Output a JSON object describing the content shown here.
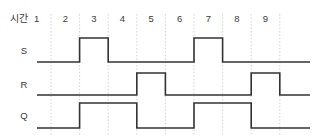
{
  "diagram": {
    "axis_caption": "시간",
    "time_ticks": [
      "1",
      "2",
      "3",
      "4",
      "5",
      "6",
      "7",
      "8",
      "9"
    ],
    "signals": [
      {
        "name": "S",
        "label": "S"
      },
      {
        "name": "R",
        "label": "R"
      },
      {
        "name": "Q",
        "label": "Q"
      }
    ],
    "colors": {
      "background": "#ffffff",
      "waveform": "#333333",
      "gridline": "#c9c9c9",
      "text": "#3a3a3a"
    }
  },
  "chart_data": {
    "type": "line",
    "xlabel": "시간",
    "ylabel": "",
    "grid": true,
    "legend": "none",
    "x": [
      1,
      2,
      3,
      4,
      5,
      6,
      7,
      8,
      9
    ],
    "xlim": [
      1,
      9
    ],
    "ylim": [
      0,
      1
    ],
    "categories": [
      "1",
      "2",
      "3",
      "4",
      "5",
      "6",
      "7",
      "8",
      "9"
    ],
    "series": [
      {
        "name": "S",
        "type": "digital",
        "values": [
          0,
          1,
          0,
          0,
          0,
          1,
          0,
          0,
          0
        ],
        "transitions": [
          {
            "time": 2,
            "level": 1
          },
          {
            "time": 3,
            "level": 0
          },
          {
            "time": 6,
            "level": 1
          },
          {
            "time": 7,
            "level": 0
          }
        ]
      },
      {
        "name": "R",
        "type": "digital",
        "values": [
          0,
          0,
          0,
          1,
          0,
          0,
          0,
          1,
          0
        ],
        "transitions": [
          {
            "time": 4,
            "level": 1
          },
          {
            "time": 5,
            "level": 0
          },
          {
            "time": 8,
            "level": 1
          },
          {
            "time": 9,
            "level": 0
          }
        ]
      },
      {
        "name": "Q",
        "type": "digital",
        "values": [
          0,
          1,
          1,
          0,
          0,
          1,
          1,
          0,
          0
        ],
        "transitions": [
          {
            "time": 2,
            "level": 1
          },
          {
            "time": 4,
            "level": 0
          },
          {
            "time": 6,
            "level": 1
          },
          {
            "time": 8,
            "level": 0
          }
        ]
      }
    ]
  },
  "geometry": {
    "x_start": 51,
    "x_step": 28.6,
    "tick_count": 9,
    "plot_left": 37,
    "plot_right": 310,
    "grid_top": 14,
    "grid_bottom": 136,
    "tick_label_y": 22,
    "rows": [
      {
        "name": "S",
        "high": 38,
        "low": 62,
        "label_x": 24,
        "label_y": 54
      },
      {
        "name": "R",
        "high": 73,
        "low": 95,
        "label_x": 24,
        "label_y": 88
      },
      {
        "name": "Q",
        "high": 103,
        "low": 128,
        "label_x": 24,
        "label_y": 119
      }
    ],
    "caption_x": 10,
    "caption_y": 22
  }
}
